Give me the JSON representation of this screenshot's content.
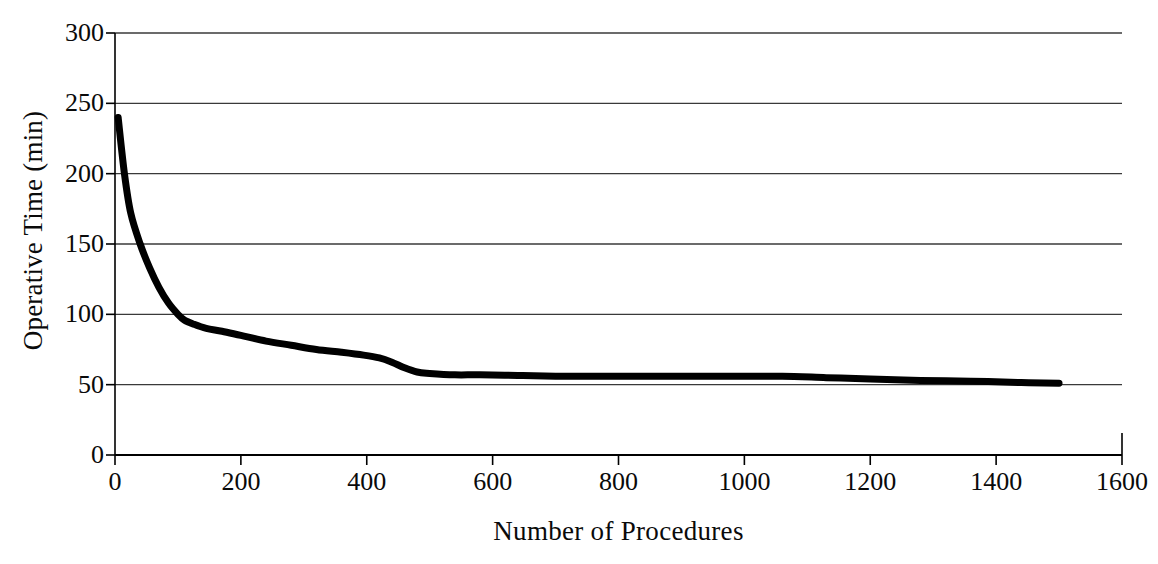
{
  "chart_data": {
    "type": "line",
    "title": "",
    "xlabel": "Number of Procedures",
    "ylabel": "Operative Time (min)",
    "xlim": [
      0,
      1600
    ],
    "ylim": [
      0,
      300
    ],
    "xticks": [
      0,
      200,
      400,
      600,
      800,
      1000,
      1200,
      1400,
      1600
    ],
    "xtick_labels": [
      "0",
      "200",
      "400",
      "600",
      "800",
      "1000",
      "1200",
      "1400",
      "1600"
    ],
    "yticks": [
      0,
      50,
      100,
      150,
      200,
      250,
      300
    ],
    "ytick_labels": [
      "0",
      "50",
      "100",
      "150",
      "200",
      "250",
      "300"
    ],
    "grid": "horizontal",
    "legend": "none",
    "series": [
      {
        "name": "Operative Time",
        "color": "#000000",
        "line_width": 7,
        "x": [
          5,
          15,
          25,
          40,
          55,
          70,
          85,
          100,
          110,
          125,
          145,
          170,
          200,
          240,
          280,
          320,
          360,
          395,
          420,
          440,
          460,
          480,
          500,
          540,
          580,
          640,
          700,
          760,
          820,
          880,
          940,
          1000,
          1060,
          1130,
          1200,
          1280,
          1360,
          1440,
          1500
        ],
        "y": [
          240,
          200,
          172,
          150,
          133,
          119,
          108,
          100,
          96,
          93,
          90,
          88,
          85,
          81,
          78,
          75,
          73,
          71,
          69,
          66,
          62,
          59,
          58,
          57,
          57,
          56.5,
          56,
          56,
          56,
          56,
          56,
          56,
          56,
          55,
          54,
          53,
          52.5,
          51.5,
          51
        ]
      }
    ],
    "annotations": {
      "start_value": 240,
      "end_value": 51,
      "elbow_x": 110,
      "elbow_y": 96,
      "plateau_value": 56
    },
    "axis_color": "#000000",
    "grid_color": "#3a3a3a",
    "background": "#ffffff"
  },
  "axes": {
    "y_title": "Operative Time (min)",
    "x_title": "Number of Procedures"
  }
}
